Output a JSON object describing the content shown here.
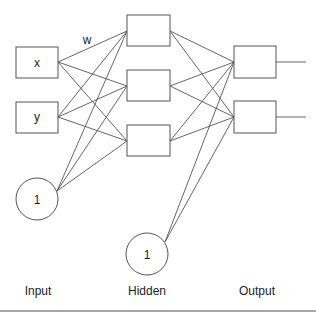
{
  "diagram": {
    "weight_label": "w",
    "layers": [
      {
        "name": "Input",
        "label": "Input"
      },
      {
        "name": "Hidden",
        "label": "Hidden"
      },
      {
        "name": "Output",
        "label": "Output"
      }
    ],
    "input_nodes": [
      {
        "id": "x",
        "label": "x"
      },
      {
        "id": "y",
        "label": "y"
      }
    ],
    "input_bias": {
      "label": "1"
    },
    "hidden_nodes": [
      {
        "id": "h1",
        "label": ""
      },
      {
        "id": "h2",
        "label": ""
      },
      {
        "id": "h3",
        "label": ""
      }
    ],
    "hidden_bias": {
      "label": "1"
    },
    "output_nodes": [
      {
        "id": "o1",
        "label": ""
      },
      {
        "id": "o2",
        "label": ""
      }
    ],
    "colors": {
      "stroke": "#555555",
      "text": "#222222",
      "rule": "#888888"
    }
  }
}
